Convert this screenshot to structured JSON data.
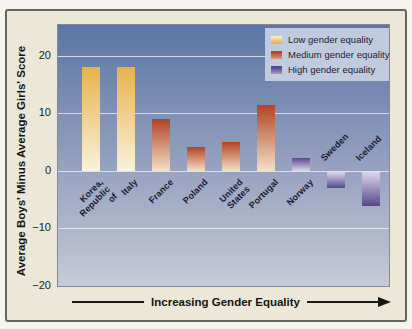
{
  "figure": {
    "outer_bg": "#f5f4ee",
    "frame_bg": "#ece7d6",
    "frame_border": "#64655f",
    "plot_border": "#85889a",
    "gridline_color": "rgba(235,240,248,0.8)"
  },
  "chart_data": {
    "type": "bar",
    "title": "",
    "ylabel": "Average Boys' Minus Average Girls' Score",
    "xlabel": "Increasing Gender Equality",
    "ylim": [
      -20,
      25.3
    ],
    "yticks": [
      20,
      10,
      0,
      -10,
      -20
    ],
    "gridlines_at": [
      20,
      10,
      0,
      -10
    ],
    "grid": "on",
    "categories": [
      "Korea,\nRepublic of",
      "Italy",
      "France",
      "Poland",
      "United\nStates",
      "Portugal",
      "Norway",
      "Sweden",
      "Iceland"
    ],
    "values": [
      18,
      18,
      9,
      4.1,
      5,
      11.5,
      2.3,
      -2.9,
      -6
    ],
    "groups": [
      "low",
      "low",
      "medium",
      "medium",
      "medium",
      "medium",
      "high",
      "high",
      "high"
    ],
    "group_colors": {
      "low": {
        "dark": "#e8b24b",
        "light": "#f9f2dc"
      },
      "medium": {
        "dark": "#b34325",
        "light": "#f2e0c8"
      },
      "high": {
        "dark": "#57478d",
        "light": "#dcd8e8"
      }
    },
    "plot_bg_top": "#5a76a3",
    "plot_bg_mid": "#97a2bf",
    "plot_bg_bottom": "#c6cad8",
    "legend": {
      "bg": "rgba(200,209,226,0.93)",
      "position": "top-right",
      "items": [
        {
          "label": "Low gender equality",
          "group": "low"
        },
        {
          "label": "Medium gender equality",
          "group": "medium"
        },
        {
          "label": "High gender equality",
          "group": "high"
        }
      ]
    }
  }
}
